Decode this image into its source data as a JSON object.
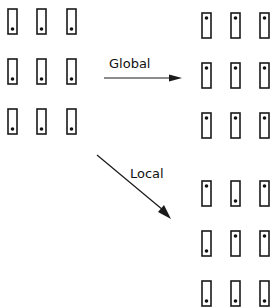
{
  "diagram": {
    "title": "",
    "dot_legend": {
      "T": "dot-top",
      "B": "dot-bottom"
    },
    "grids": [
      {
        "id": "source",
        "rows": [
          [
            "B",
            "B",
            "B"
          ],
          [
            "B",
            "B",
            "B"
          ],
          [
            "B",
            "B",
            "B"
          ]
        ]
      },
      {
        "id": "global",
        "rows": [
          [
            "T",
            "T",
            "T"
          ],
          [
            "T",
            "T",
            "T"
          ],
          [
            "T",
            "T",
            "T"
          ]
        ]
      },
      {
        "id": "local",
        "rows": [
          [
            "T",
            "B",
            "T"
          ],
          [
            "B",
            "T",
            "T"
          ],
          [
            "B",
            "B",
            "B"
          ]
        ]
      }
    ],
    "arrows": [
      {
        "id": "global",
        "label": "Global",
        "from": "source",
        "to": "global"
      },
      {
        "id": "local",
        "label": "Local",
        "from": "source",
        "to": "local"
      }
    ]
  }
}
